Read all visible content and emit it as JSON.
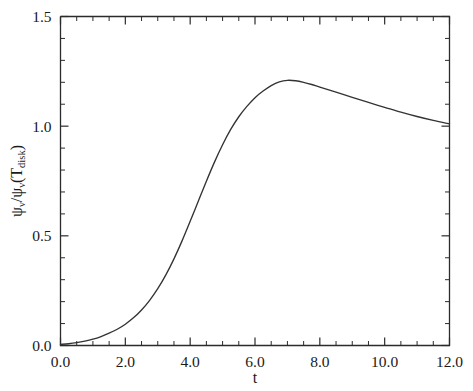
{
  "chart_data": {
    "type": "line",
    "title": "",
    "xlabel": "t",
    "ylabel": "psi_v / psi_v(T_disk)",
    "ylabel_parts": {
      "psi1": "ψ",
      "sub1": "ν",
      "slash": "/",
      "psi2": "ψ",
      "sub2": "ν",
      "open": "(T",
      "sub3": "disk",
      "close": ")"
    },
    "xlim": [
      0.0,
      12.0
    ],
    "ylim": [
      0.0,
      1.5
    ],
    "xticks": [
      "0.0",
      "2.0",
      "4.0",
      "6.0",
      "8.0",
      "10.0",
      "12.0"
    ],
    "xtick_values": [
      0.0,
      2.0,
      4.0,
      6.0,
      8.0,
      10.0,
      12.0
    ],
    "xtick_minor_step": 0.5,
    "yticks": [
      "0.0",
      "0.5",
      "1.0",
      "1.5"
    ],
    "ytick_values": [
      0.0,
      0.5,
      1.0,
      1.5
    ],
    "ytick_minor_step": 0.1,
    "grid": false,
    "legend": null,
    "line_color": "#333333",
    "series": [
      {
        "name": "psi_v ratio",
        "x": [
          0.0,
          0.25,
          0.5,
          0.75,
          1.0,
          1.25,
          1.5,
          1.75,
          2.0,
          2.25,
          2.5,
          2.75,
          3.0,
          3.25,
          3.5,
          3.75,
          4.0,
          4.25,
          4.5,
          4.75,
          5.0,
          5.25,
          5.5,
          5.75,
          6.0,
          6.25,
          6.5,
          6.75,
          7.0,
          7.25,
          7.5,
          7.75,
          8.0,
          8.5,
          9.0,
          9.5,
          10.0,
          10.5,
          11.0,
          11.5,
          12.0
        ],
        "y": [
          0.005,
          0.008,
          0.013,
          0.02,
          0.029,
          0.041,
          0.056,
          0.074,
          0.097,
          0.126,
          0.162,
          0.206,
          0.259,
          0.322,
          0.395,
          0.477,
          0.566,
          0.658,
          0.749,
          0.836,
          0.915,
          0.985,
          1.043,
          1.09,
          1.13,
          1.16,
          1.185,
          1.202,
          1.209,
          1.207,
          1.2,
          1.19,
          1.178,
          1.155,
          1.131,
          1.108,
          1.086,
          1.064,
          1.044,
          1.026,
          1.01
        ]
      }
    ],
    "annotations": {
      "peak_value": 1.21,
      "peak_t": 6.85,
      "end_value": 1.01,
      "start_value": 0.0
    }
  },
  "figure": {
    "background_color": "#ffffff",
    "axis_color": "#2b2b2b",
    "width": 473,
    "height": 391
  }
}
